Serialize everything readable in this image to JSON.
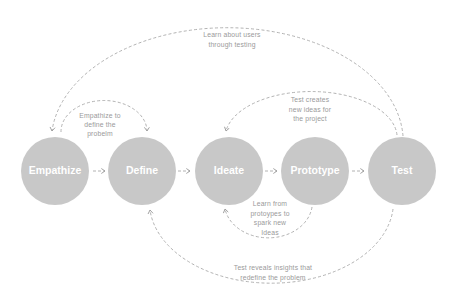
{
  "diagram": {
    "colors": {
      "background": "#ffffff",
      "circle": "#c8c8c8",
      "circle_text": "#ffffff",
      "line": "#a9a9a9",
      "label_text": "#9a9a9a"
    },
    "stages": [
      {
        "label": "Empathize"
      },
      {
        "label": "Define"
      },
      {
        "label": "Ideate"
      },
      {
        "label": "Prototype"
      },
      {
        "label": "Test"
      }
    ],
    "forward_arrows": [
      {
        "from": "Empathize",
        "to": "Define",
        "icon": "dashed-arrow-right-icon"
      },
      {
        "from": "Define",
        "to": "Ideate",
        "icon": "dashed-arrow-right-icon"
      },
      {
        "from": "Ideate",
        "to": "Prototype",
        "icon": "dashed-arrow-right-icon"
      },
      {
        "from": "Prototype",
        "to": "Test",
        "icon": "dashed-arrow-right-icon"
      }
    ],
    "feedback_loops": [
      {
        "from": "Test",
        "to": "Empathize",
        "lines": [
          "Learn about users",
          "through testing"
        ]
      },
      {
        "from": "Empathize",
        "to": "Define",
        "lines": [
          "Empathize to",
          "define the",
          "probelm"
        ]
      },
      {
        "from": "Test",
        "to": "Ideate",
        "lines": [
          "Test creates",
          "new ideas for",
          "the project"
        ]
      },
      {
        "from": "Prototype",
        "to": "Ideate",
        "lines": [
          "Learn from",
          "protoypes to",
          "spark new",
          "Ideas"
        ]
      },
      {
        "from": "Test",
        "to": "Define",
        "lines": [
          "Test reveals insights that",
          "redefine the problem"
        ]
      }
    ]
  }
}
